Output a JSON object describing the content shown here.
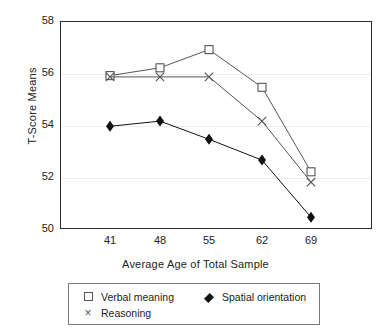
{
  "chart_data": {
    "type": "line",
    "title": "",
    "xlabel": "Average Age of Total Sample",
    "ylabel": "T-Score Means",
    "categories": [
      "41",
      "48",
      "55",
      "62",
      "69"
    ],
    "x": [
      41,
      48,
      55,
      62,
      69
    ],
    "xticklabels": [
      "41",
      "48",
      "55",
      "62",
      "69"
    ],
    "yticklabels": [
      "50",
      "52",
      "54",
      "56",
      "58"
    ],
    "yticks": [
      50,
      52,
      54,
      56,
      58
    ],
    "ylim": [
      50,
      58
    ],
    "grid": true,
    "legend_position": "below-axes",
    "series": [
      {
        "name": "Verbal meaning",
        "marker": "open-square",
        "color": "#555555",
        "values": [
          55.9,
          56.2,
          56.9,
          55.45,
          52.2
        ]
      },
      {
        "name": "Reasoning",
        "marker": "x",
        "color": "#555555",
        "values": [
          55.85,
          55.85,
          55.85,
          54.15,
          51.8
        ]
      },
      {
        "name": "Spatial orientation",
        "marker": "filled-diamond",
        "color": "#111111",
        "values": [
          53.95,
          54.15,
          53.45,
          52.65,
          50.45
        ]
      }
    ]
  },
  "axes": {
    "ylabel": "T-Score Means",
    "xlabel": "Average Age of Total Sample",
    "yticks": [
      "58",
      "56",
      "54",
      "52",
      "50"
    ],
    "xticks": [
      "41",
      "48",
      "55",
      "62",
      "69"
    ]
  },
  "legend": {
    "items": [
      {
        "label": "Verbal meaning",
        "marker": "open-square-icon"
      },
      {
        "label": "Reasoning",
        "marker": "x-cross-icon"
      },
      {
        "label": "Spatial orientation",
        "marker": "filled-diamond-icon"
      }
    ]
  }
}
